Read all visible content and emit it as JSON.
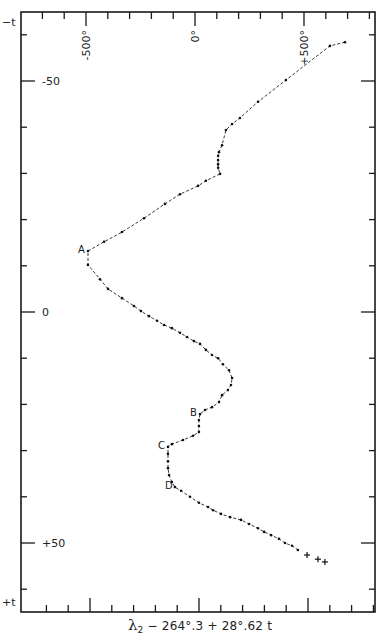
{
  "chart_data": {
    "type": "line",
    "title": "",
    "xlabel": "λ₂ − 264°.3 + 28°.62 t",
    "xlabel_parts": {
      "symbol": "λ",
      "subscript": "2",
      "rest": " − 264°.3 + 28°.62 t"
    },
    "ylabel_top": "−t",
    "ylabel_bottom": "+t",
    "x_tick_labels": [
      {
        "value": -500,
        "label": "-500°"
      },
      {
        "value": 0,
        "label": "0°"
      },
      {
        "value": 500,
        "label": "+500°"
      }
    ],
    "y_tick_labels": [
      {
        "value": -50,
        "label": "-50"
      },
      {
        "value": 0,
        "label": "0"
      },
      {
        "value": 50,
        "label": "+50"
      }
    ],
    "xlim": [
      -590,
      790
    ],
    "ylim": [
      -65,
      65
    ],
    "x_minor_step": 100,
    "y_minor_step": 10,
    "grid": false,
    "annotations": [
      {
        "label": "A",
        "x": -491,
        "t": -13.2
      },
      {
        "label": "B",
        "x": 23,
        "t": 22.1
      },
      {
        "label": "C",
        "x": -124,
        "t": 29.2
      },
      {
        "label": "D",
        "x": -92,
        "t": 37.9
      }
    ],
    "series": [
      {
        "name": "observations (dots)",
        "marker": "dot",
        "points": [
          [
            688,
            -58.4
          ],
          [
            619,
            -57.6
          ],
          [
            417,
            -50.2
          ],
          [
            289,
            -45.5
          ],
          [
            206,
            -42.0
          ],
          [
            170,
            -40.7
          ],
          [
            142,
            -39.4
          ],
          [
            124,
            -36.1
          ],
          [
            110,
            -34.6
          ],
          [
            106,
            -33.8
          ],
          [
            106,
            -32.9
          ],
          [
            106,
            -32.0
          ],
          [
            106,
            -31.2
          ],
          [
            115,
            -29.9
          ],
          [
            50,
            -28.4
          ],
          [
            14,
            -27.3
          ],
          [
            -69,
            -25.5
          ],
          [
            -138,
            -23.4
          ],
          [
            -234,
            -20.3
          ],
          [
            -335,
            -17.3
          ],
          [
            -417,
            -15.2
          ],
          [
            -491,
            -13.2
          ],
          [
            -491,
            -10.2
          ],
          [
            -436,
            -7.1
          ],
          [
            -399,
            -5.0
          ],
          [
            -335,
            -3.0
          ],
          [
            -280,
            -1.3
          ],
          [
            -248,
            -0.2
          ],
          [
            -211,
            0.9
          ],
          [
            -174,
            1.9
          ],
          [
            -142,
            2.8
          ],
          [
            -106,
            3.5
          ],
          [
            -69,
            4.5
          ],
          [
            -37,
            5.4
          ],
          [
            -5,
            6.3
          ],
          [
            23,
            6.9
          ],
          [
            50,
            8.2
          ],
          [
            78,
            9.3
          ],
          [
            106,
            10.0
          ],
          [
            128,
            11.3
          ],
          [
            156,
            12.6
          ],
          [
            170,
            14.3
          ],
          [
            165,
            15.8
          ],
          [
            151,
            16.9
          ],
          [
            124,
            18.0
          ],
          [
            110,
            19.5
          ],
          [
            78,
            20.6
          ],
          [
            46,
            21.2
          ],
          [
            23,
            22.1
          ],
          [
            18,
            23.4
          ],
          [
            18,
            24.7
          ],
          [
            18,
            26.0
          ],
          [
            -9,
            26.8
          ],
          [
            -55,
            27.7
          ],
          [
            -106,
            28.6
          ],
          [
            -124,
            29.2
          ],
          [
            -124,
            30.7
          ],
          [
            -124,
            32.3
          ],
          [
            -124,
            33.8
          ],
          [
            -119,
            35.3
          ],
          [
            -106,
            36.8
          ],
          [
            -92,
            37.9
          ],
          [
            -64,
            38.7
          ],
          [
            -23,
            40.0
          ],
          [
            18,
            41.3
          ],
          [
            60,
            42.2
          ],
          [
            83,
            42.9
          ],
          [
            119,
            43.7
          ],
          [
            161,
            44.4
          ],
          [
            211,
            45.0
          ],
          [
            248,
            45.9
          ],
          [
            289,
            46.8
          ],
          [
            317,
            47.6
          ],
          [
            349,
            48.3
          ],
          [
            385,
            49.1
          ],
          [
            413,
            50.0
          ],
          [
            445,
            50.6
          ],
          [
            472,
            51.5
          ]
        ]
      },
      {
        "name": "observations (crosses)",
        "marker": "cross",
        "points": [
          [
            514,
            52.6
          ],
          [
            564,
            53.5
          ],
          [
            596,
            54.1
          ]
        ]
      }
    ]
  }
}
